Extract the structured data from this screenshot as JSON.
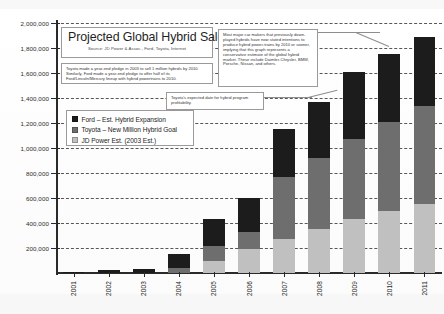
{
  "chart_data": {
    "type": "bar",
    "subtype": "stacked-column",
    "title": "Projected Global Hybrid Sales",
    "source": "Source: JD Power & Assoc., Ford, Toyota, Internet",
    "xlabel": "",
    "ylabel": "",
    "ylim": [
      0,
      2000000
    ],
    "ytick_step": 200000,
    "grid": true,
    "gridline_style": "dashed-horizontal",
    "legend_position": "inside-upper-left",
    "categories": [
      "2001",
      "2002",
      "2003",
      "2004",
      "2005",
      "2006",
      "2007",
      "2008",
      "2009",
      "2010",
      "2011"
    ],
    "ytick_labels": [
      "200,000",
      "400,000",
      "600,000",
      "800,000",
      "1,000,000",
      "1,200,000",
      "1,400,000",
      "1,600,000",
      "1,800,000",
      "2,000,000"
    ],
    "ytick_values": [
      200000,
      400000,
      600000,
      800000,
      1000000,
      1200000,
      1400000,
      1600000,
      1800000,
      2000000
    ],
    "series": [
      {
        "name": "JD Power Est. (2003 Est.)",
        "color": "#c0c0c0",
        "values": [
          10000,
          25000,
          35000,
          115000,
          215000,
          270000,
          390000,
          450000,
          535000,
          545000,
          555000
        ]
      },
      {
        "name": "Toyota – New Million Hybrid Goal",
        "color": "#6e6e6e",
        "values": [
          0,
          0,
          0,
          40000,
          125000,
          140000,
          490000,
          570000,
          640000,
          705000,
          780000
        ]
      },
      {
        "name": "Ford – Est. Hybrid Expansion",
        "color": "#1c1c1c",
        "values": [
          0,
          0,
          0,
          0,
          95000,
          190000,
          275000,
          350000,
          430000,
          500000,
          555000
        ]
      }
    ],
    "totals": [
      10000,
      25000,
      35000,
      155000,
      435000,
      600000,
      1155000,
      1370000,
      1605000,
      1750000,
      1890000
    ],
    "legend_entries": [
      "Ford – Est. Hybrid Expansion",
      "Toyota – New Million Hybrid Goal",
      "JD Power Est. (2003 Est.)"
    ],
    "annotations": [
      {
        "id": "note-left",
        "text": "Toyota made a year-end pledge in 2003 to sell 1 million hybrids by 2010. Similarly, Ford made a year-end pledge to offer half of its Ford/Lincoln/Mercury lineup with hybrid powertrains to 2010."
      },
      {
        "id": "note-right",
        "text": "Most major car makers that previously down-played hybrids have now stated intentions to produce hybrid power-trains by 2010 or sooner, implying that this graph represents a conservative estimate of the global hybrid market. These include Daimler-Chrysler, BMW, Porsche, Nissan, and others."
      },
      {
        "id": "note-mid",
        "text": "Toyota's expected date for hybrid program profitability."
      }
    ],
    "colors": {
      "jd_power": "#c0c0c0",
      "toyota": "#6e6e6e",
      "ford": "#1c1c1c",
      "axis": "#2a2a2a",
      "gridline": "#3a3a3a",
      "callout_border": "#9a9a9a",
      "background": "#ffffff"
    }
  }
}
